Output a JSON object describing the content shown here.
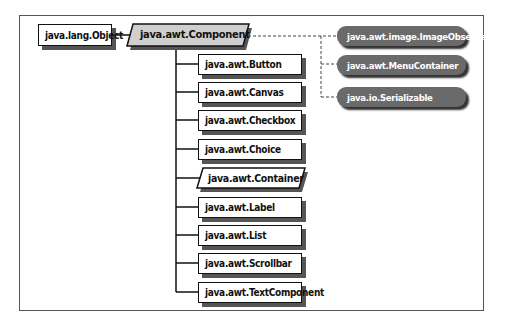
{
  "diagram": {
    "type": "class-hierarchy",
    "root": {
      "label": "java.lang.Object"
    },
    "focus_class": {
      "label": "java.awt.Component",
      "style": "abstract-parallelogram-shaded"
    },
    "interfaces": [
      {
        "label": "java.awt.image.ImageObserver"
      },
      {
        "label": "java.awt.MenuContainer"
      },
      {
        "label": "java.io.Serializable"
      }
    ],
    "subclasses": [
      {
        "label": "java.awt.Button"
      },
      {
        "label": "java.awt.Canvas"
      },
      {
        "label": "java.awt.Checkbox"
      },
      {
        "label": "java.awt.Choice"
      },
      {
        "label": "java.awt.Container",
        "abstract": true
      },
      {
        "label": "java.awt.Label"
      },
      {
        "label": "java.awt.List"
      },
      {
        "label": "java.awt.Scrollbar"
      },
      {
        "label": "java.awt.TextComponent"
      }
    ]
  }
}
